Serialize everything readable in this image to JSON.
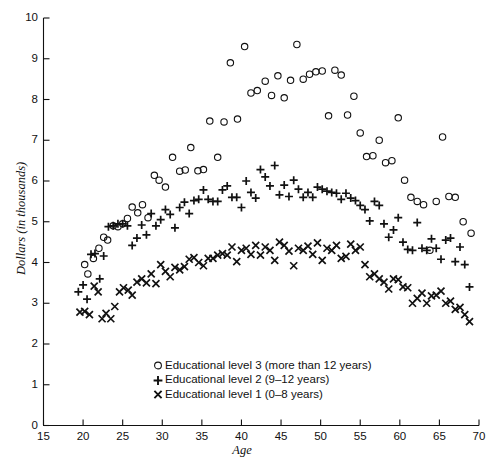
{
  "chart_data": {
    "type": "scatter",
    "title": "",
    "xlabel": "Age",
    "ylabel": "Dollars (in thousands)",
    "xlim": [
      15,
      70
    ],
    "ylim": [
      0,
      10
    ],
    "xticks": [
      15,
      20,
      25,
      30,
      35,
      40,
      45,
      50,
      55,
      60,
      65,
      70
    ],
    "yticks": [
      0,
      1,
      2,
      3,
      4,
      5,
      6,
      7,
      8,
      9,
      10
    ],
    "grid": false,
    "legend_position": "lower-left-inside",
    "series": [
      {
        "name": "Educational level 3 (more than 12 years)",
        "marker": "circle",
        "color": "#111111",
        "points": [
          [
            20.2,
            3.95
          ],
          [
            20.6,
            3.72
          ],
          [
            21.3,
            4.1
          ],
          [
            22.0,
            4.35
          ],
          [
            22.6,
            4.62
          ],
          [
            23.1,
            4.55
          ],
          [
            23.8,
            4.9
          ],
          [
            24.4,
            4.88
          ],
          [
            25.0,
            4.95
          ],
          [
            25.6,
            5.08
          ],
          [
            26.2,
            5.36
          ],
          [
            26.9,
            5.22
          ],
          [
            27.5,
            5.42
          ],
          [
            28.2,
            5.1
          ],
          [
            29.0,
            6.14
          ],
          [
            29.6,
            6.02
          ],
          [
            30.4,
            5.85
          ],
          [
            31.3,
            6.58
          ],
          [
            32.2,
            6.24
          ],
          [
            32.9,
            6.27
          ],
          [
            33.6,
            6.82
          ],
          [
            34.5,
            6.25
          ],
          [
            35.2,
            6.28
          ],
          [
            36.0,
            7.47
          ],
          [
            37.0,
            6.58
          ],
          [
            37.8,
            7.45
          ],
          [
            38.6,
            8.9
          ],
          [
            39.5,
            7.52
          ],
          [
            40.4,
            9.3
          ],
          [
            41.2,
            8.16
          ],
          [
            42.0,
            8.22
          ],
          [
            43.0,
            8.45
          ],
          [
            43.8,
            8.1
          ],
          [
            44.6,
            8.58
          ],
          [
            45.4,
            8.04
          ],
          [
            46.2,
            8.47
          ],
          [
            47.0,
            9.35
          ],
          [
            47.8,
            8.5
          ],
          [
            48.6,
            8.62
          ],
          [
            49.4,
            8.68
          ],
          [
            50.2,
            8.7
          ],
          [
            51.0,
            7.6
          ],
          [
            51.8,
            8.72
          ],
          [
            52.6,
            8.6
          ],
          [
            53.4,
            7.62
          ],
          [
            54.2,
            8.08
          ],
          [
            55.0,
            7.18
          ],
          [
            55.8,
            6.6
          ],
          [
            56.6,
            6.62
          ],
          [
            57.4,
            7.0
          ],
          [
            58.2,
            6.45
          ],
          [
            59.0,
            6.5
          ],
          [
            59.8,
            7.55
          ],
          [
            60.6,
            6.02
          ],
          [
            61.4,
            5.6
          ],
          [
            62.2,
            5.5
          ],
          [
            63.0,
            5.42
          ],
          [
            63.8,
            4.3
          ],
          [
            64.6,
            5.5
          ],
          [
            65.4,
            7.08
          ],
          [
            66.2,
            5.62
          ],
          [
            67.0,
            5.6
          ],
          [
            68.0,
            5.0
          ],
          [
            69.0,
            4.72
          ]
        ]
      },
      {
        "name": "Educational level 2 (9–12 years)",
        "marker": "plus",
        "color": "#111111",
        "points": [
          [
            19.4,
            3.28
          ],
          [
            20.0,
            3.45
          ],
          [
            20.5,
            3.1
          ],
          [
            21.0,
            4.2
          ],
          [
            21.5,
            4.22
          ],
          [
            22.1,
            3.6
          ],
          [
            22.6,
            4.16
          ],
          [
            23.2,
            4.88
          ],
          [
            23.8,
            4.9
          ],
          [
            24.4,
            4.95
          ],
          [
            25.0,
            4.95
          ],
          [
            25.6,
            4.9
          ],
          [
            26.2,
            4.42
          ],
          [
            26.8,
            4.6
          ],
          [
            27.4,
            4.92
          ],
          [
            28.0,
            4.68
          ],
          [
            28.6,
            5.2
          ],
          [
            29.2,
            4.9
          ],
          [
            29.8,
            5.05
          ],
          [
            30.4,
            5.3
          ],
          [
            31.0,
            5.18
          ],
          [
            31.6,
            4.85
          ],
          [
            32.2,
            5.35
          ],
          [
            32.8,
            5.48
          ],
          [
            33.4,
            5.2
          ],
          [
            34.0,
            5.52
          ],
          [
            34.6,
            5.55
          ],
          [
            35.2,
            5.78
          ],
          [
            35.8,
            5.55
          ],
          [
            36.4,
            5.5
          ],
          [
            37.0,
            5.5
          ],
          [
            37.6,
            5.78
          ],
          [
            38.2,
            5.88
          ],
          [
            38.8,
            5.6
          ],
          [
            39.4,
            5.6
          ],
          [
            40.0,
            5.35
          ],
          [
            40.6,
            6.0
          ],
          [
            41.2,
            5.72
          ],
          [
            41.8,
            5.58
          ],
          [
            42.4,
            6.28
          ],
          [
            43.0,
            6.1
          ],
          [
            43.6,
            5.88
          ],
          [
            44.2,
            6.38
          ],
          [
            44.8,
            5.66
          ],
          [
            45.4,
            5.9
          ],
          [
            46.0,
            5.62
          ],
          [
            46.6,
            6.02
          ],
          [
            47.2,
            5.8
          ],
          [
            47.8,
            5.6
          ],
          [
            48.4,
            5.72
          ],
          [
            49.0,
            5.6
          ],
          [
            49.6,
            5.85
          ],
          [
            50.2,
            5.8
          ],
          [
            50.8,
            5.75
          ],
          [
            51.4,
            5.72
          ],
          [
            52.0,
            5.7
          ],
          [
            52.6,
            5.55
          ],
          [
            53.2,
            5.7
          ],
          [
            53.8,
            5.58
          ],
          [
            54.4,
            5.52
          ],
          [
            55.0,
            5.4
          ],
          [
            55.6,
            5.3
          ],
          [
            56.2,
            5.02
          ],
          [
            56.8,
            5.5
          ],
          [
            57.4,
            5.4
          ],
          [
            58.0,
            4.95
          ],
          [
            58.6,
            4.62
          ],
          [
            59.2,
            4.8
          ],
          [
            59.8,
            5.1
          ],
          [
            60.4,
            4.5
          ],
          [
            61.0,
            4.32
          ],
          [
            61.6,
            4.3
          ],
          [
            62.2,
            4.98
          ],
          [
            62.8,
            4.35
          ],
          [
            63.4,
            4.3
          ],
          [
            64.0,
            4.58
          ],
          [
            64.6,
            4.35
          ],
          [
            65.2,
            4.08
          ],
          [
            65.8,
            4.55
          ],
          [
            66.4,
            4.6
          ],
          [
            67.0,
            4.02
          ],
          [
            67.6,
            4.38
          ],
          [
            68.2,
            3.95
          ],
          [
            68.8,
            3.4
          ]
        ]
      },
      {
        "name": "Educational level 1 (0–8 years)",
        "marker": "x",
        "color": "#111111",
        "points": [
          [
            19.6,
            2.78
          ],
          [
            20.2,
            2.8
          ],
          [
            20.8,
            2.72
          ],
          [
            21.4,
            3.42
          ],
          [
            21.9,
            3.28
          ],
          [
            22.4,
            2.62
          ],
          [
            22.9,
            2.75
          ],
          [
            23.5,
            2.62
          ],
          [
            24.0,
            2.92
          ],
          [
            24.6,
            3.28
          ],
          [
            25.1,
            3.38
          ],
          [
            25.7,
            3.32
          ],
          [
            26.2,
            3.2
          ],
          [
            26.8,
            3.52
          ],
          [
            27.4,
            3.6
          ],
          [
            28.0,
            3.5
          ],
          [
            28.6,
            3.72
          ],
          [
            29.2,
            3.48
          ],
          [
            29.8,
            3.95
          ],
          [
            30.4,
            3.78
          ],
          [
            31.0,
            3.65
          ],
          [
            31.6,
            3.88
          ],
          [
            32.2,
            3.82
          ],
          [
            32.8,
            3.9
          ],
          [
            33.4,
            4.08
          ],
          [
            34.0,
            4.12
          ],
          [
            34.6,
            4.0
          ],
          [
            35.2,
            3.92
          ],
          [
            35.8,
            4.1
          ],
          [
            36.4,
            4.1
          ],
          [
            37.0,
            4.18
          ],
          [
            37.6,
            4.22
          ],
          [
            38.2,
            4.18
          ],
          [
            38.8,
            4.38
          ],
          [
            39.4,
            4.02
          ],
          [
            40.0,
            4.3
          ],
          [
            40.6,
            4.35
          ],
          [
            41.2,
            4.2
          ],
          [
            41.8,
            4.42
          ],
          [
            42.4,
            4.18
          ],
          [
            43.0,
            4.38
          ],
          [
            43.6,
            4.3
          ],
          [
            44.2,
            4.05
          ],
          [
            44.8,
            4.5
          ],
          [
            45.4,
            4.42
          ],
          [
            46.0,
            4.28
          ],
          [
            46.6,
            3.92
          ],
          [
            47.2,
            4.35
          ],
          [
            47.8,
            4.3
          ],
          [
            48.4,
            4.4
          ],
          [
            49.0,
            4.2
          ],
          [
            49.6,
            4.48
          ],
          [
            50.2,
            4.05
          ],
          [
            50.8,
            4.35
          ],
          [
            51.4,
            4.3
          ],
          [
            52.0,
            4.42
          ],
          [
            52.6,
            4.1
          ],
          [
            53.2,
            4.15
          ],
          [
            53.8,
            4.45
          ],
          [
            54.4,
            4.3
          ],
          [
            55.0,
            4.38
          ],
          [
            55.6,
            3.95
          ],
          [
            56.2,
            3.65
          ],
          [
            56.8,
            3.72
          ],
          [
            57.4,
            3.6
          ],
          [
            58.0,
            3.52
          ],
          [
            58.6,
            3.35
          ],
          [
            59.2,
            3.6
          ],
          [
            59.8,
            3.58
          ],
          [
            60.4,
            3.4
          ],
          [
            61.0,
            3.38
          ],
          [
            61.6,
            3.0
          ],
          [
            62.2,
            3.12
          ],
          [
            62.8,
            3.25
          ],
          [
            63.4,
            3.0
          ],
          [
            64.0,
            3.18
          ],
          [
            64.6,
            3.2
          ],
          [
            65.2,
            3.3
          ],
          [
            65.8,
            3.0
          ],
          [
            66.4,
            3.05
          ],
          [
            67.0,
            2.85
          ],
          [
            67.6,
            2.9
          ],
          [
            68.2,
            2.72
          ],
          [
            68.8,
            2.55
          ]
        ]
      }
    ]
  },
  "axes": {
    "y_title": "Dollars (in thousands)",
    "x_title": "Age",
    "y_tick_labels": [
      "10",
      "9",
      "8",
      "7",
      "6",
      "5",
      "4",
      "3",
      "2",
      "1",
      "0"
    ],
    "x_tick_labels": [
      "15",
      "20",
      "25",
      "30",
      "35",
      "40",
      "45",
      "50",
      "55",
      "60",
      "65",
      "70"
    ]
  },
  "legend": {
    "entries": [
      {
        "marker": "circle",
        "label": "Educational level 3 (more than 12 years)"
      },
      {
        "marker": "plus",
        "label": "Educational level 2 (9–12 years)"
      },
      {
        "marker": "x",
        "label": "Educational level 1 (0–8 years)"
      }
    ]
  }
}
